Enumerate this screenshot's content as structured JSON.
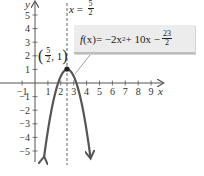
{
  "chart_data": {
    "type": "line",
    "title": "",
    "function_label": "f(x) = −2x² + 10x − 23/2",
    "function": {
      "a": -2,
      "b": 10,
      "c": -11.5
    },
    "xlabel": "x",
    "ylabel": "y",
    "xlim": [
      -1.6,
      10
    ],
    "ylim": [
      -6,
      6
    ],
    "x_ticks": [
      -1,
      1,
      2,
      3,
      4,
      5,
      6,
      7,
      8,
      9
    ],
    "y_ticks": [
      -5,
      -4,
      -3,
      -2,
      -1,
      1,
      2,
      3,
      4,
      5
    ],
    "vertex": {
      "x": 2.5,
      "y": 1,
      "label": "(5/2, 1)"
    },
    "axis_of_symmetry": {
      "x": 2.5,
      "label": "x = 5/2",
      "style": "dashed"
    },
    "series": [
      {
        "name": "f(x)",
        "x_range": [
          0.7,
          4.3
        ],
        "arrows": "both-ends-down",
        "color": "#555555"
      }
    ],
    "grid": false,
    "colors": {
      "curve": "#555555",
      "axes": "#555555",
      "box": "#ececec",
      "text": "#222222"
    }
  },
  "labels": {
    "y_axis": "y",
    "x_axis": "x",
    "axis_eq_prefix": "x",
    "axis_eq_equals": "=",
    "axis_eq_num": "5",
    "axis_eq_den": "2",
    "vertex_num": "5",
    "vertex_den": "2",
    "vertex_y": "1",
    "formula_f": "f",
    "formula_x": "(x)",
    "formula_mid": " = −2x",
    "formula_sup": "2",
    "formula_rest": " + 10x −",
    "formula_num": "23",
    "formula_den": "2",
    "x_tick_labels": [
      "−1",
      "1",
      "2",
      "3",
      "4",
      "5",
      "6",
      "7",
      "8",
      "9"
    ],
    "y_tick_labels": [
      "5",
      "4",
      "3",
      "2",
      "1",
      "−1",
      "−2",
      "−3",
      "−4",
      "−5"
    ]
  }
}
